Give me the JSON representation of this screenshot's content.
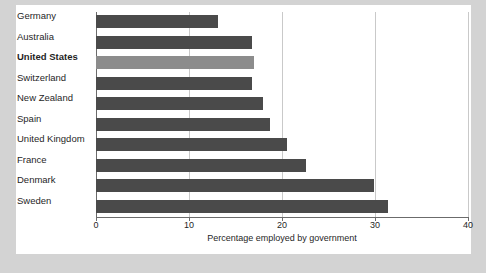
{
  "chart_data": {
    "type": "bar",
    "orientation": "horizontal",
    "title": "",
    "xlabel": "Percentage employed by government",
    "ylabel": "",
    "categories": [
      "Germany",
      "Australia",
      "United States",
      "Switzerland",
      "New Zealand",
      "Spain",
      "United Kingdom",
      "France",
      "Denmark",
      "Sweden"
    ],
    "values": [
      13.1,
      16.8,
      17.0,
      16.8,
      18.0,
      18.7,
      20.5,
      22.6,
      29.9,
      31.4
    ],
    "highlight_category": "United States",
    "xlim": [
      0,
      40
    ],
    "xticks": [
      0,
      10,
      20,
      30,
      40
    ],
    "xtick_labels": [
      "0",
      "10",
      "20",
      "30",
      "40"
    ],
    "grid": "vertical",
    "legend": "none",
    "bar_color": "#4a4a4a",
    "highlight_color": "#8c8c8c",
    "gridline_color": "#c9c9c9",
    "axis_color": "#6b6b6b",
    "panel_background": "#ffffff",
    "figure_background": "#d3d3d3"
  }
}
